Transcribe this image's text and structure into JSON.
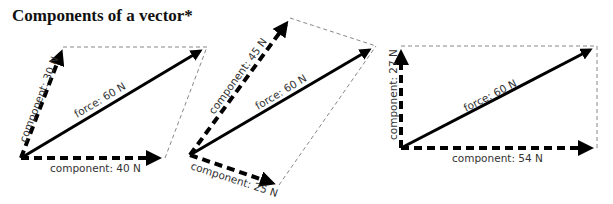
{
  "title": "Components of a vector*",
  "colors": {
    "stroke": "#000000",
    "guide": "#888888",
    "text": "#333333"
  },
  "diagrams": [
    {
      "force": {
        "label": "force: 60 N"
      },
      "components": [
        {
          "label": "component: 30 N"
        },
        {
          "label": "component: 40 N"
        }
      ]
    },
    {
      "force": {
        "label": "force: 60 N"
      },
      "components": [
        {
          "label": "component: 45 N"
        },
        {
          "label": "component: 25 N"
        }
      ]
    },
    {
      "force": {
        "label": "force: 60 N"
      },
      "components": [
        {
          "label": "component: 27 N"
        },
        {
          "label": "component: 54 N"
        }
      ]
    }
  ]
}
